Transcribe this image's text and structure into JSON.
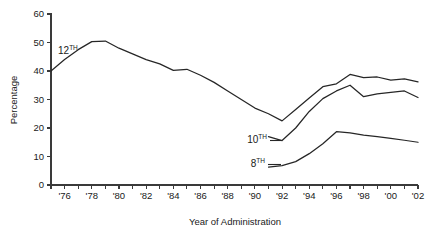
{
  "chart_data": {
    "type": "line",
    "title": "",
    "xlabel": "Year of Administration",
    "ylabel": "Percentage",
    "ylim": [
      0,
      60
    ],
    "xlim": [
      1975,
      2002
    ],
    "grid": false,
    "legend_position": "inline-label",
    "y_ticks": [
      0,
      10,
      20,
      30,
      40,
      50,
      60
    ],
    "y_tick_labels": [
      "0",
      "10",
      "20",
      "30",
      "40",
      "50",
      "60"
    ],
    "x_ticks": [
      1975,
      1976,
      1977,
      1978,
      1979,
      1980,
      1981,
      1982,
      1983,
      1984,
      1985,
      1986,
      1987,
      1988,
      1989,
      1990,
      1991,
      1992,
      1993,
      1994,
      1995,
      1996,
      1997,
      1998,
      1999,
      2000,
      2001,
      2002
    ],
    "x_tick_labels": [
      "",
      "'76",
      "",
      "'78",
      "",
      "'80",
      "",
      "'82",
      "",
      "'84",
      "",
      "'86",
      "",
      "'88",
      "",
      "'90",
      "",
      "'92",
      "",
      "'94",
      "",
      "'96",
      "",
      "'98",
      "",
      "'00",
      "",
      "'02"
    ],
    "series": [
      {
        "name": "12TH",
        "label_text": "12",
        "label_sup": "TH",
        "x": [
          1975,
          1976,
          1977,
          1978,
          1979,
          1980,
          1981,
          1982,
          1983,
          1984,
          1985,
          1986,
          1987,
          1988,
          1989,
          1990,
          1991,
          1992,
          1993,
          1994,
          1995,
          1996,
          1997,
          1998,
          1999,
          2000,
          2001,
          2002
        ],
        "values": [
          40.0,
          44.0,
          47.5,
          50.3,
          50.5,
          48.0,
          46.0,
          44.0,
          42.5,
          40.2,
          40.6,
          38.5,
          36.0,
          33.0,
          30.0,
          27.0,
          25.0,
          22.5,
          26.5,
          30.5,
          34.5,
          35.5,
          38.8,
          37.7,
          37.9,
          36.8,
          37.2,
          36.2
        ]
      },
      {
        "name": "10TH",
        "label_text": "10",
        "label_sup": "TH",
        "x": [
          1991,
          1992,
          1993,
          1994,
          1995,
          1996,
          1997,
          1998,
          1999,
          2000,
          2001,
          2002
        ],
        "values": [
          17.0,
          15.6,
          20.0,
          25.8,
          30.3,
          33.0,
          35.0,
          31.0,
          32.0,
          32.5,
          33.0,
          30.7
        ]
      },
      {
        "name": "8TH",
        "label_text": "8",
        "label_sup": "TH",
        "x": [
          1991,
          1992,
          1993,
          1994,
          1995,
          1996,
          1997,
          1998,
          1999,
          2000,
          2001,
          2002
        ],
        "values": [
          6.3,
          6.8,
          8.2,
          11.0,
          14.5,
          18.7,
          18.3,
          17.5,
          17.0,
          16.4,
          15.7,
          15.0
        ]
      }
    ]
  },
  "axes": {
    "y_title": "Percentage",
    "x_title": "Year of Administration"
  }
}
